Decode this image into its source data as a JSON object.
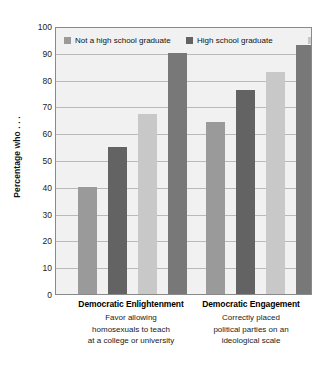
{
  "chart_data": {
    "type": "bar",
    "title": "",
    "subtitle": "",
    "xlabel": "",
    "ylabel": "Percentage who . . .",
    "ylim": [
      0,
      100
    ],
    "ytick_step": 10,
    "yticks": [
      100,
      90,
      80,
      70,
      60,
      50,
      40,
      30,
      20,
      10,
      0
    ],
    "grid": true,
    "grid_axis": "y",
    "legend_position": "inside-top-left",
    "categories": [
      "Democratic Enlightenment",
      "Democratic Engagement"
    ],
    "category_descriptions": [
      [
        "Favor allowing",
        "homosexuals to teach",
        "at a college or university"
      ],
      [
        "Correctly placed",
        "political parties on an",
        "ideological scale"
      ]
    ],
    "series": [
      {
        "name": "Not a high school graduate",
        "color": "#9a9a9a",
        "values": [
          40,
          64
        ]
      },
      {
        "name": "High school graduate",
        "color": "#636363",
        "values": [
          55,
          76
        ]
      },
      {
        "name": "Some college",
        "color": "#c8c8c8",
        "values": [
          67,
          83
        ]
      },
      {
        "name": "College graduate",
        "color": "#787878",
        "values": [
          90,
          93
        ]
      }
    ]
  },
  "legend": {
    "entries": [
      {
        "label": "Not a high school graduate",
        "color": "#9a9a9a"
      },
      {
        "label": "High school graduate",
        "color": "#636363"
      },
      {
        "label": "Some college",
        "color": "#c8c8c8"
      },
      {
        "label": "College graduate",
        "color": "#787878"
      }
    ]
  },
  "style": {
    "plot_background": "#f1f1f1",
    "frame_color": "#8a8a8a",
    "gridline_color": "#b9b9b9",
    "page_background": "#ffffff",
    "text_color": "#111111"
  }
}
